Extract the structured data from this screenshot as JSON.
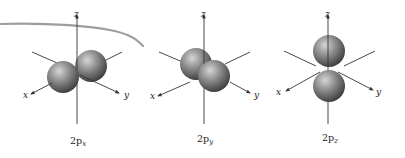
{
  "figure": {
    "orbitals": [
      {
        "id": "2px",
        "label_main": "2p",
        "label_sub": "x",
        "center_x": 77,
        "lobe_axis": "x",
        "axis_labels": {
          "z": "z",
          "x": "x",
          "y": "y"
        }
      },
      {
        "id": "2py",
        "label_main": "2p",
        "label_sub": "y",
        "center_x": 204,
        "lobe_axis": "y",
        "axis_labels": {
          "z": "z",
          "x": "x",
          "y": "y"
        }
      },
      {
        "id": "2pz",
        "label_main": "2p",
        "label_sub": "z",
        "center_x": 328,
        "lobe_axis": "z",
        "axis_labels": {
          "z": "z",
          "x": "x",
          "y": "y"
        }
      }
    ],
    "colors": {
      "axis": "#333333",
      "lobe_light": "#c8c8c8",
      "lobe_mid": "#8a8a8a",
      "lobe_dark": "#4a4a4a",
      "pencil_stroke": "#8c8c8c",
      "text": "#222222"
    }
  }
}
